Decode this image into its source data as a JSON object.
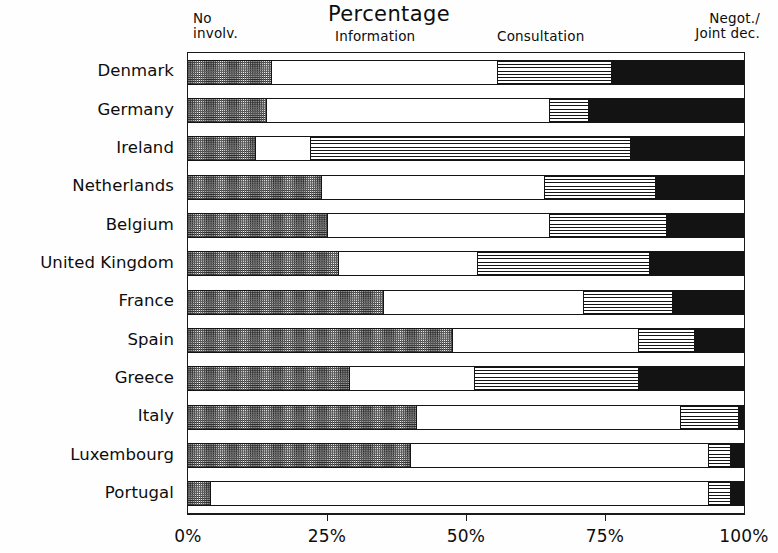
{
  "chart_data": {
    "type": "bar",
    "orientation": "horizontal",
    "stacked": true,
    "normalized_percent": true,
    "title": "Percentage",
    "xlabel": "",
    "ylabel": "",
    "xlim": [
      0,
      100
    ],
    "grid": false,
    "legend_position": "top",
    "xticks": [
      "0%",
      "25%",
      "50%",
      "75%",
      "100%"
    ],
    "xtick_values": [
      0,
      25,
      50,
      75,
      100
    ],
    "categories": [
      "Denmark",
      "Germany",
      "Ireland",
      "Netherlands",
      "Belgium",
      "United Kingdom",
      "France",
      "Spain",
      "Greece",
      "Italy",
      "Luxembourg",
      "Portugal"
    ],
    "series": [
      {
        "name": "No involv.",
        "pattern": "dotted-checker",
        "color": "#2b2b2b",
        "values": [
          15,
          14,
          12,
          24,
          25,
          27,
          35,
          47.5,
          29,
          41,
          40,
          4
        ]
      },
      {
        "name": "Information",
        "pattern": "white",
        "color": "#ffffff",
        "values": [
          40.5,
          51,
          10,
          40,
          40,
          25,
          36,
          33.5,
          22.5,
          47.5,
          53.5,
          89.5
        ]
      },
      {
        "name": "Consultation",
        "pattern": "horizontal-lines",
        "color": "#151515",
        "values": [
          20.5,
          7,
          57.5,
          20,
          21,
          31,
          16,
          10,
          29.5,
          10.5,
          4,
          4
        ]
      },
      {
        "name": "Negot./Joint dec.",
        "pattern": "solid-black",
        "color": "#131313",
        "values": [
          24,
          28,
          20.5,
          16,
          14,
          17,
          13,
          9,
          19,
          1,
          2.5,
          2.5
        ]
      }
    ]
  },
  "legend": {
    "no_involv_line1": "No",
    "no_involv_line2": "involv.",
    "information": "Information",
    "consultation": "Consultation",
    "negot_line1": "Negot./",
    "negot_line2": "Joint dec."
  }
}
